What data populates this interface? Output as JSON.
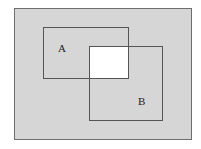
{
  "diagram": {
    "type": "venn-rectangles",
    "colors": {
      "shaded": "#d6d6d6",
      "unshaded": "#ffffff",
      "stroke": "#555555"
    },
    "sets": [
      {
        "label": "A"
      },
      {
        "label": "B"
      }
    ],
    "shaded_region": "complement of A ∩ B",
    "unshaded_region": "A ∩ B"
  }
}
